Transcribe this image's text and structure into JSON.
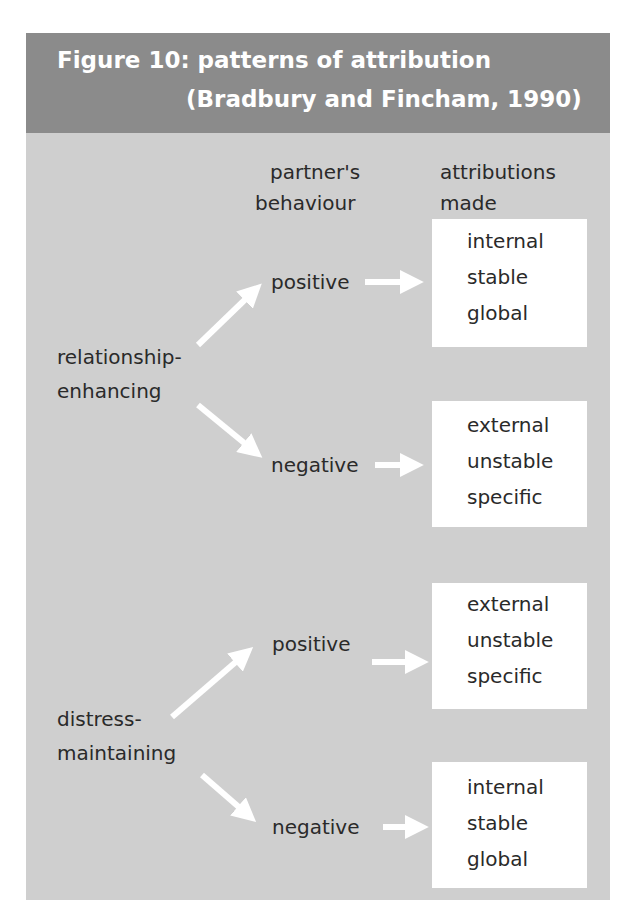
{
  "figure": {
    "title_line1": "Figure 10: patterns of attribution",
    "title_line2": "(Bradbury and Fincham, 1990)",
    "colors": {
      "header_bg": "#8b8b8b",
      "panel_bg": "#cfcfcf",
      "box_bg": "#ffffff",
      "arrow": "#ffffff",
      "text": "#2a2a2a"
    }
  },
  "columns": {
    "behaviour_line1": "partner's",
    "behaviour_line2": "behaviour",
    "attributions_line1": "attributions",
    "attributions_line2": "made"
  },
  "groups": [
    {
      "label_line1": "relationship-",
      "label_line2": "enhancing",
      "branches": [
        {
          "behaviour": "positive",
          "attributions": [
            "internal",
            "stable",
            "global"
          ]
        },
        {
          "behaviour": "negative",
          "attributions": [
            "external",
            "unstable",
            "specific"
          ]
        }
      ]
    },
    {
      "label_line1": "distress-",
      "label_line2": "maintaining",
      "branches": [
        {
          "behaviour": "positive",
          "attributions": [
            "external",
            "unstable",
            "specific"
          ]
        },
        {
          "behaviour": "negative",
          "attributions": [
            "internal",
            "stable",
            "global"
          ]
        }
      ]
    }
  ]
}
